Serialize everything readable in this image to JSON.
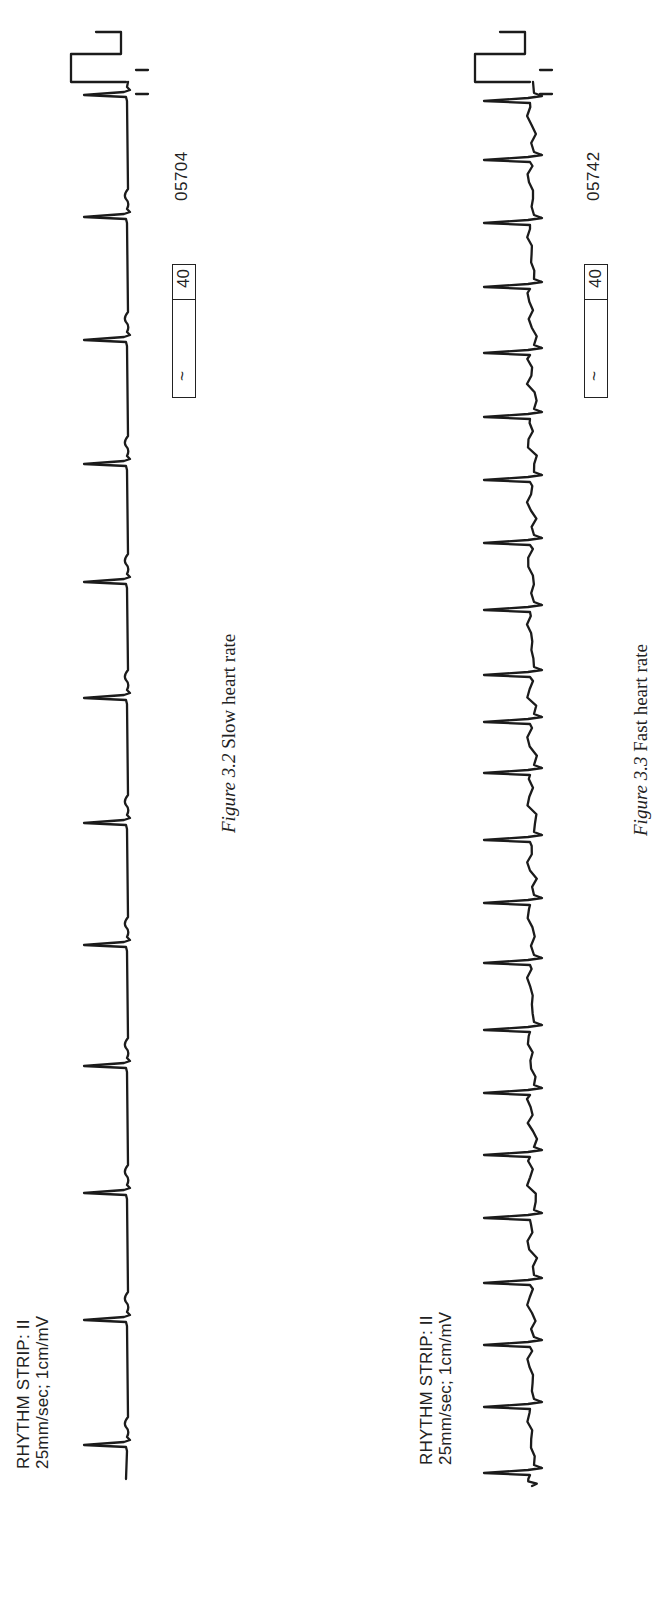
{
  "figures": [
    {
      "id": "slow",
      "strip_label_line1": "RHYTHM STRIP: II",
      "strip_label_line2": "25mm/sec; 1cm/mV",
      "rate_box_symbol": "~",
      "rate_box_value": "40",
      "strip_id": "05704",
      "caption_fig": "Figure 3.2",
      "caption_text": "Slow heart rate",
      "beats_x": [
        156,
        281,
        408,
        535,
        656,
        778,
        903,
        1019,
        1137,
        1261,
        1384,
        1506
      ],
      "baseline_y": 126,
      "start_x": 122,
      "end_x": 1519,
      "qrs_height": 42,
      "style": "slow"
    },
    {
      "id": "fast",
      "strip_label_line1": "RHYTHM STRIP: II",
      "strip_label_line2": "25mm/sec; 1cm/mV",
      "rate_box_symbol": "~",
      "rate_box_value": "40",
      "strip_id": "05742",
      "caption_fig": "Figure 3.3",
      "caption_text": "Fast heart rate",
      "beats_x": [
        128,
        194,
        256,
        318,
        383,
        446,
        508,
        571,
        638,
        698,
        761,
        828,
        879,
        926,
        991,
        1058,
        1121,
        1184,
        1248,
        1314,
        1378,
        1441,
        1500
      ],
      "baseline_y": 530,
      "start_x": 115,
      "end_x": 1519,
      "qrs_height": 46,
      "style": "fast"
    }
  ],
  "chart_data": [
    {
      "type": "line",
      "title": "Figure 3.2 Slow heart rate",
      "lead": "II",
      "paper_speed": "25mm/sec",
      "gain": "1cm/mV",
      "rate_box": "40",
      "strip_number": "05704",
      "beat_count": 12,
      "rhythm": "regular, slow"
    },
    {
      "type": "line",
      "title": "Figure 3.3 Fast heart rate",
      "lead": "II",
      "paper_speed": "25mm/sec",
      "gain": "1cm/mV",
      "rate_box": "40",
      "strip_number": "05742",
      "beat_count": 23,
      "rhythm": "regular, fast"
    }
  ]
}
